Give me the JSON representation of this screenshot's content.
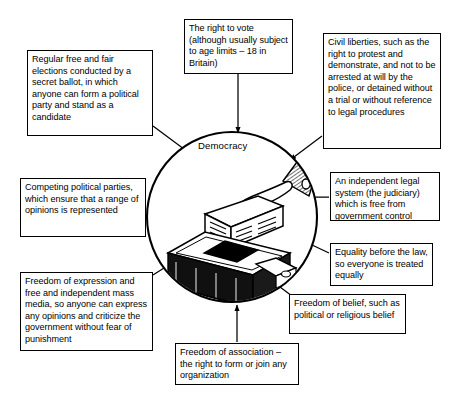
{
  "diagram": {
    "title_center": "Democracy",
    "center_illustration": "hand-posting-ballot-paper-into-ballot-box",
    "notes": [
      {
        "id": "elections",
        "name": "note-free-fair-elections",
        "text": "Regular free and fair elections conducted by a secret ballot, in which anyone can form a political party and stand as a candidate"
      },
      {
        "id": "vote",
        "name": "note-right-to-vote",
        "text": "The right to vote (although usually subject to age limits – 18 in Britain)"
      },
      {
        "id": "civil",
        "name": "note-civil-liberties",
        "text": "Civil liberties, such as the right to protest and demonstrate, and not to be arrested at will by the police, or detained without a trial or without reference to legal procedures"
      },
      {
        "id": "parties",
        "name": "note-competing-parties",
        "text": "Competing political parties, which ensure that a range of opinions is represented"
      },
      {
        "id": "judiciary",
        "name": "note-independent-judiciary",
        "text": "An independent legal system (the judiciary) which is free from government control"
      },
      {
        "id": "equality",
        "name": "note-equality-before-law",
        "text": "Equality before the law, so everyone is treated equally"
      },
      {
        "id": "expression",
        "name": "note-freedom-of-expression",
        "text": "Freedom of expression and free and independent mass media, so anyone can express any opinions and criticize the government without fear of punishment"
      },
      {
        "id": "belief",
        "name": "note-freedom-of-belief",
        "text": "Freedom of belief, such as political or religious belief"
      },
      {
        "id": "association",
        "name": "note-freedom-of-association",
        "text": "Freedom of association – the right to form or join any organization"
      }
    ],
    "colors": {
      "ink": "#000000",
      "paper": "#ffffff"
    }
  }
}
